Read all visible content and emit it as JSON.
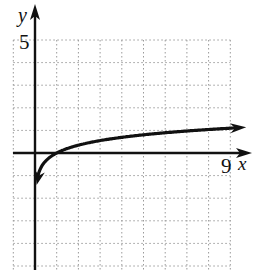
{
  "header_fragment": "a cut-off line of text",
  "chart_data": {
    "type": "line",
    "title": "",
    "xlabel": "x",
    "ylabel": "y",
    "tick_labels": {
      "x": [
        "9"
      ],
      "y": [
        "5"
      ]
    },
    "xlim": [
      -1,
      9
    ],
    "ylim": [
      -5,
      5
    ],
    "grid": true,
    "grid_step": 1,
    "legend": null,
    "series": [
      {
        "name": "y = ln(x)/2 (logarithmic curve)",
        "x": [
          0.1,
          0.25,
          0.5,
          1,
          2,
          3,
          4,
          5,
          6,
          7,
          8,
          9.5
        ],
        "values": [
          -1.15,
          -0.69,
          -0.35,
          0,
          0.35,
          0.55,
          0.69,
          0.8,
          0.9,
          0.97,
          1.04,
          1.13
        ],
        "arrow_ends": true
      }
    ],
    "annotations": [
      {
        "text": "y",
        "at": "top of y-axis"
      },
      {
        "text": "5",
        "at": "y = 5"
      },
      {
        "text": "9",
        "at": "x = 9"
      },
      {
        "text": "x",
        "at": "right end of x-axis"
      }
    ]
  },
  "labels": {
    "y_axis": "y",
    "x_axis": "x",
    "y_tick": "5",
    "x_tick": "9"
  },
  "colors": {
    "curve": "#111111",
    "axis": "#111111",
    "grid": "#9a9a9a"
  }
}
